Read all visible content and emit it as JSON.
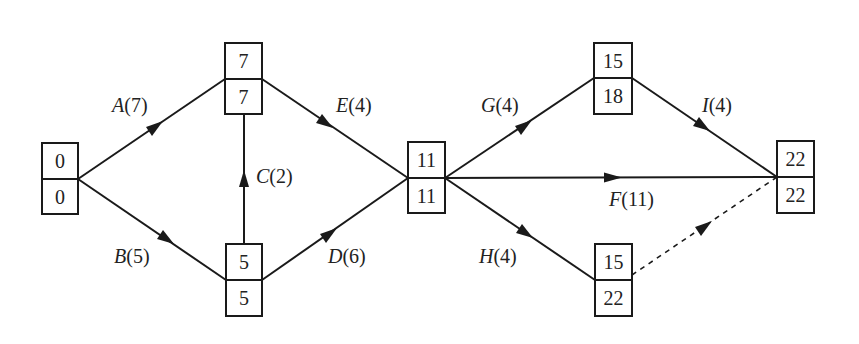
{
  "diagram": {
    "type": "activity-on-arrow network",
    "nodes": [
      {
        "id": "n0",
        "top": "0",
        "bottom": "0"
      },
      {
        "id": "n1",
        "top": "7",
        "bottom": "7"
      },
      {
        "id": "n2",
        "top": "5",
        "bottom": "5"
      },
      {
        "id": "n3",
        "top": "11",
        "bottom": "11"
      },
      {
        "id": "n4",
        "top": "15",
        "bottom": "18"
      },
      {
        "id": "n5",
        "top": "15",
        "bottom": "22"
      },
      {
        "id": "n6",
        "top": "22",
        "bottom": "22"
      }
    ],
    "edges": [
      {
        "id": "A",
        "letter": "A",
        "duration": "(7)",
        "from": "n0",
        "to": "n1",
        "style": "solid"
      },
      {
        "id": "B",
        "letter": "B",
        "duration": "(5)",
        "from": "n0",
        "to": "n2",
        "style": "solid"
      },
      {
        "id": "C",
        "letter": "C",
        "duration": "(2)",
        "from": "n2",
        "to": "n1",
        "style": "solid"
      },
      {
        "id": "E",
        "letter": "E",
        "duration": "(4)",
        "from": "n1",
        "to": "n3",
        "style": "solid"
      },
      {
        "id": "D",
        "letter": "D",
        "duration": "(6)",
        "from": "n2",
        "to": "n3",
        "style": "solid"
      },
      {
        "id": "G",
        "letter": "G",
        "duration": "(4)",
        "from": "n3",
        "to": "n4",
        "style": "solid"
      },
      {
        "id": "F",
        "letter": "F",
        "duration": "(11)",
        "from": "n3",
        "to": "n6",
        "style": "solid"
      },
      {
        "id": "H",
        "letter": "H",
        "duration": "(4)",
        "from": "n3",
        "to": "n5",
        "style": "solid"
      },
      {
        "id": "I",
        "letter": "I",
        "duration": "(4)",
        "from": "n4",
        "to": "n6",
        "style": "solid"
      },
      {
        "id": "dummy",
        "letter": "",
        "duration": "",
        "from": "n5",
        "to": "n6",
        "style": "dashed"
      }
    ],
    "colors": {
      "stroke": "#1a1a1a",
      "text": "#222222",
      "background": "#ffffff"
    }
  }
}
